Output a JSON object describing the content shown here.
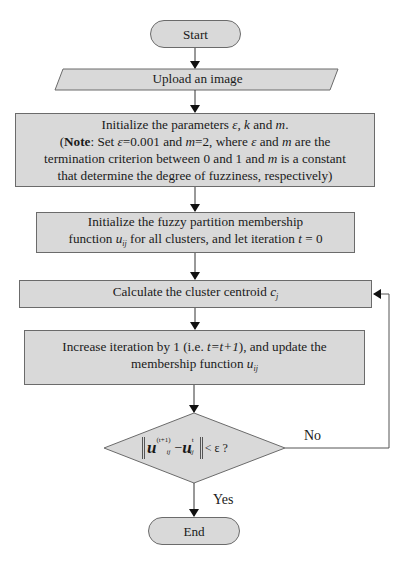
{
  "flowchart": {
    "start": {
      "label": "Start"
    },
    "upload": {
      "label": "Upload an image"
    },
    "init_params": {
      "line1_prefix": "Initialize the parameters ",
      "line1_vars": "ε, k",
      "line1_mid": " and ",
      "line1_m": "m",
      "line1_end": ".",
      "note_open": "(",
      "note_label": "Note",
      "note_text1": ": Set ",
      "note_eps": "ε",
      "note_text2": "=0.001 and ",
      "note_m": "m",
      "note_text3": "=2, where ",
      "note_eps2": "ε",
      "note_text4": " and ",
      "note_m2": "m",
      "note_text5": " are the",
      "line3_prefix": "termination criterion between 0 and 1 and ",
      "line3_m": "m",
      "line3_suffix": " is a constant",
      "line4": "that determine the degree of fuzziness, respectively)"
    },
    "init_membership": {
      "line1": "Initialize the fuzzy partition membership",
      "line2_prefix": "function ",
      "line2_var": "u",
      "line2_sub": "ij",
      "line2_mid": " for all clusters, and let iteration ",
      "line2_t": "t",
      "line2_end": " = 0"
    },
    "centroid": {
      "prefix": "Calculate the cluster centroid ",
      "var": "c",
      "sub": "j"
    },
    "increase": {
      "line1_prefix": "Increase iteration by 1 (i.e. ",
      "line1_expr": "t=t+1",
      "line1_suffix": "), and update the",
      "line2_prefix": "membership function  ",
      "line2_var": "u",
      "line2_sub": "ij"
    },
    "decision": {
      "u1": "u",
      "sup1": "(t+1)",
      "sub1": "ij",
      "minus": " − ",
      "u2": "u",
      "sup2": "t",
      "sub2": "ij",
      "tail": " < ε ?"
    },
    "no_label": "No",
    "yes_label": "Yes",
    "end": {
      "label": "End"
    }
  },
  "colors": {
    "fill": "#d9d9d9",
    "stroke": "#6b6b6b",
    "background": "#ffffff"
  }
}
